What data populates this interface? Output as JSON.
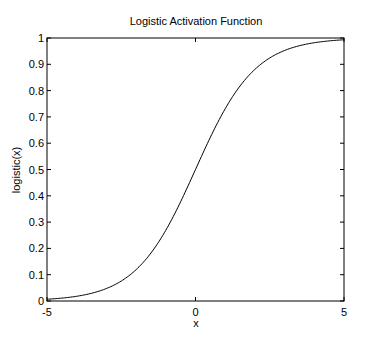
{
  "chart_data": {
    "type": "line",
    "title": "Logistic Activation Function",
    "xlabel": "x",
    "ylabel": "logistic(x)",
    "xlim": [
      -5,
      5
    ],
    "ylim": [
      0,
      1
    ],
    "x_ticks": [
      -5,
      0,
      5
    ],
    "x_tick_labels": [
      "-5",
      "0",
      "5"
    ],
    "y_ticks": [
      0,
      0.1,
      0.2,
      0.3,
      0.4,
      0.5,
      0.6,
      0.7,
      0.8,
      0.9,
      1
    ],
    "y_tick_labels": [
      "0",
      "0.1",
      "0.2",
      "0.3",
      "0.4",
      "0.5",
      "0.6",
      "0.7",
      "0.8",
      "0.9",
      "1"
    ],
    "grid": false,
    "legend": null,
    "series": [
      {
        "name": "logistic(x)",
        "color": "#000000",
        "x": [
          -5,
          -4.5,
          -4,
          -3.5,
          -3,
          -2.5,
          -2,
          -1.5,
          -1,
          -0.5,
          0,
          0.5,
          1,
          1.5,
          2,
          2.5,
          3,
          3.5,
          4,
          4.5,
          5
        ],
        "values": [
          0.0067,
          0.011,
          0.018,
          0.0293,
          0.0474,
          0.0759,
          0.1192,
          0.1824,
          0.2689,
          0.3775,
          0.5,
          0.6225,
          0.7311,
          0.8176,
          0.8808,
          0.9241,
          0.9526,
          0.9707,
          0.982,
          0.989,
          0.9933
        ]
      }
    ]
  },
  "colors": {
    "background": "#ffffff",
    "axes": "#000000",
    "line": "#000000"
  }
}
